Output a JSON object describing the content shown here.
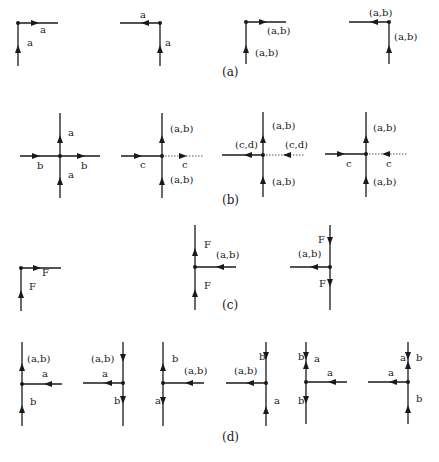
{
  "figure": {
    "captions": {
      "a": "(a)",
      "b": "(b)",
      "c": "(c)",
      "d": "(d)"
    },
    "panels": {
      "a": [
        {
          "id": "a1",
          "type": "corner",
          "labels": [
            "a",
            "a"
          ]
        },
        {
          "id": "a2",
          "type": "corner",
          "labels": [
            "a",
            "a"
          ]
        },
        {
          "id": "a3",
          "type": "corner",
          "labels": [
            "(a,b)",
            "(a,b)"
          ]
        },
        {
          "id": "a4",
          "type": "corner",
          "labels": [
            "(a,b)",
            "(a,b)"
          ]
        }
      ],
      "b": [
        {
          "id": "b1",
          "type": "cross",
          "labels": [
            "a",
            "b",
            "b",
            "a"
          ]
        },
        {
          "id": "b2",
          "type": "cross",
          "labels": [
            "(a,b)",
            "c",
            "c",
            "(a,b)"
          ]
        },
        {
          "id": "b3",
          "type": "cross",
          "labels": [
            "(a,b)",
            "(c,d)",
            "(c,d)",
            "(a,b)"
          ]
        },
        {
          "id": "b4",
          "type": "cross",
          "labels": [
            "(a,b)",
            "c",
            "c",
            "(a,b)"
          ]
        }
      ],
      "c": [
        {
          "id": "c1",
          "type": "corner",
          "labels": [
            "F",
            "F"
          ]
        },
        {
          "id": "c2",
          "type": "tee",
          "labels": [
            "F",
            "(a,b)",
            "F"
          ]
        },
        {
          "id": "c3",
          "type": "tee",
          "labels": [
            "F",
            "(a,b)",
            "F"
          ]
        }
      ],
      "d": [
        {
          "id": "d1",
          "type": "tee",
          "labels": [
            "(a,b)",
            "a",
            "b"
          ]
        },
        {
          "id": "d2",
          "type": "tee",
          "labels": [
            "(a,b)",
            "a",
            "b"
          ]
        },
        {
          "id": "d3",
          "type": "tee",
          "labels": [
            "b",
            "(a,b)",
            "a"
          ]
        },
        {
          "id": "d4",
          "type": "tee",
          "labels": [
            "b",
            "(a,b)",
            "a"
          ]
        },
        {
          "id": "d5",
          "type": "tee",
          "labels": [
            "b",
            "a",
            "a",
            "b"
          ]
        },
        {
          "id": "d6",
          "type": "tee",
          "labels": [
            "a",
            "b",
            "a",
            "b"
          ]
        }
      ]
    },
    "colors": {
      "line": "#1a1a1a",
      "background": "#ffffff"
    }
  }
}
